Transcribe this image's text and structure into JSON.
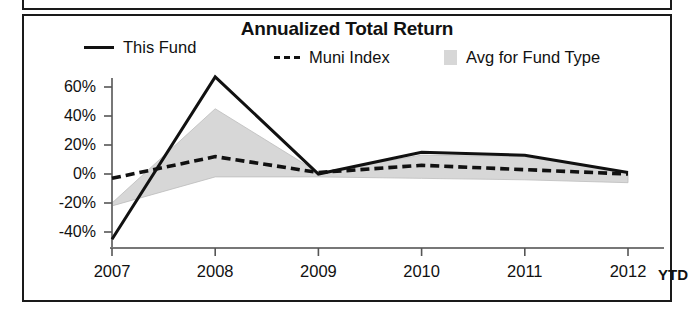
{
  "chart_data": {
    "type": "line",
    "title": "Annualized Total Return",
    "xlabel": "",
    "ylabel": "",
    "categories": [
      "2007",
      "2008",
      "2009",
      "2010",
      "2011",
      "2012"
    ],
    "x_axis_note": "YTD",
    "ylim": [
      -50,
      70
    ],
    "yticks": [
      60,
      40,
      20,
      0,
      -20,
      -40
    ],
    "ytick_labels": [
      "60%",
      "40%",
      "20%",
      "0%",
      "-20%",
      "-40%"
    ],
    "grid": false,
    "legend_position": "top",
    "series": [
      {
        "name": "This Fund",
        "style": "solid",
        "color": "#111111",
        "values": [
          -45,
          67,
          0,
          15,
          13,
          1
        ]
      },
      {
        "name": "Muni Index",
        "style": "dashed",
        "color": "#111111",
        "values": [
          -3,
          12,
          1,
          6,
          3,
          0
        ]
      },
      {
        "name": "Avg for Fund Type",
        "style": "area-band",
        "color": "#d7d7d7",
        "upper": [
          -20,
          45,
          1,
          13,
          12,
          1
        ],
        "lower": [
          -22,
          -2,
          -2,
          -3,
          -4,
          -6
        ]
      }
    ]
  },
  "legend": {
    "items": [
      {
        "label": "This Fund",
        "marker": "solid-line-swatch"
      },
      {
        "label": "Muni Index",
        "marker": "dashed-line-swatch"
      },
      {
        "label": "Avg for Fund Type",
        "marker": "gray-area-swatch"
      }
    ]
  },
  "axis": {
    "y_labels": [
      "60%",
      "40%",
      "20%",
      "0%",
      "-20%",
      "-40%"
    ],
    "x_labels": [
      "2007",
      "2008",
      "2009",
      "2010",
      "2011",
      "2012"
    ],
    "x_suffix": "YTD"
  },
  "colors": {
    "line": "#111111",
    "band": "#d7d7d7",
    "frame": "#1a1a1a",
    "background": "#ffffff"
  }
}
